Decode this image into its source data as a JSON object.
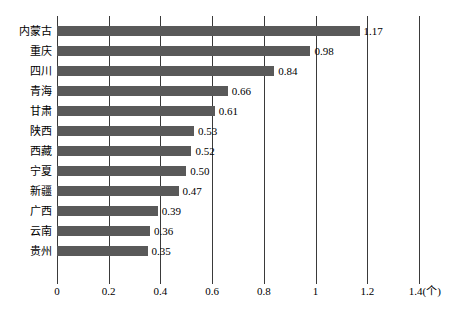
{
  "chart_data": {
    "type": "bar",
    "orientation": "horizontal",
    "title": "",
    "xlabel": "",
    "ylabel": "",
    "unit": "(个)",
    "xlim": [
      0,
      1.4
    ],
    "xticks": [
      "0",
      "0.2",
      "0.4",
      "0.6",
      "0.8",
      "1",
      "1.2",
      "1.4(个)"
    ],
    "xtick_values": [
      0,
      0.2,
      0.4,
      0.6,
      0.8,
      1,
      1.2,
      1.4
    ],
    "grid": true,
    "legend": "none",
    "bar_color": "#595959",
    "axis_color": "#3a3a3a",
    "categories": [
      "内蒙古",
      "重庆",
      "四川",
      "青海",
      "甘肃",
      "陕西",
      "西藏",
      "宁夏",
      "新疆",
      "广西",
      "云南",
      "贵州"
    ],
    "values": [
      1.17,
      0.98,
      0.84,
      0.66,
      0.61,
      0.53,
      0.52,
      0.5,
      0.47,
      0.39,
      0.36,
      0.35
    ],
    "value_labels": [
      "1.17",
      "0.98",
      "0.84",
      "0.66",
      "0.61",
      "0.53",
      "0.52",
      "0.50",
      "0.47",
      "0.39",
      "0.36",
      "0.35"
    ],
    "bars": [
      {
        "category": "内蒙古",
        "value": 1.17,
        "label": "1.17"
      },
      {
        "category": "重庆",
        "value": 0.98,
        "label": "0.98"
      },
      {
        "category": "四川",
        "value": 0.84,
        "label": "0.84"
      },
      {
        "category": "青海",
        "value": 0.66,
        "label": "0.66"
      },
      {
        "category": "甘肃",
        "value": 0.61,
        "label": "0.61"
      },
      {
        "category": "陕西",
        "value": 0.53,
        "label": "0.53"
      },
      {
        "category": "西藏",
        "value": 0.52,
        "label": "0.52"
      },
      {
        "category": "宁夏",
        "value": 0.5,
        "label": "0.50"
      },
      {
        "category": "新疆",
        "value": 0.47,
        "label": "0.47"
      },
      {
        "category": "广西",
        "value": 0.39,
        "label": "0.39"
      },
      {
        "category": "云南",
        "value": 0.36,
        "label": "0.36"
      },
      {
        "category": "贵州",
        "value": 0.35,
        "label": "0.35"
      }
    ]
  }
}
